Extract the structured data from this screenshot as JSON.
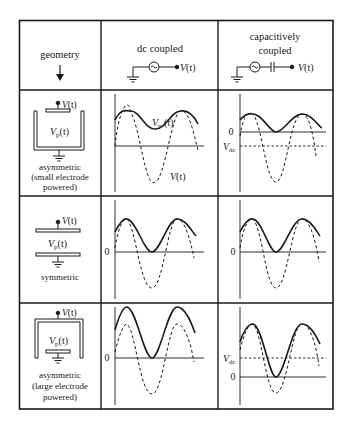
{
  "header": {
    "geometry_label": "geometry",
    "dc_label": "dc coupled",
    "cap_label_line1": "capacitively",
    "cap_label_line2": "coupled",
    "source_output_label": "V(t)"
  },
  "rows": [
    {
      "geometry_name_line1": "asymmetric",
      "geometry_name_line2": "(small electrode",
      "geometry_name_line3": "powered)",
      "electrode_label": "V(t)",
      "plasma_label": "Vp(t)",
      "dc_plot": {
        "vp_label": "Vp(t)",
        "v_label": "V(t)"
      },
      "cap_plot": {
        "zero_label": "0",
        "vdc_label": "Vdc"
      }
    },
    {
      "geometry_name_line1": "symmetric",
      "electrode_label": "V(t)",
      "plasma_label": "Vp(t)",
      "dc_plot": {
        "zero_label": "0"
      },
      "cap_plot": {
        "zero_label": "0"
      }
    },
    {
      "geometry_name_line1": "asymmetric",
      "geometry_name_line2": "(large electrode",
      "geometry_name_line3": "powered)",
      "electrode_label": "V(t)",
      "plasma_label": "Vp(t)",
      "dc_plot": {
        "zero_label": "0"
      },
      "cap_plot": {
        "zero_label": "0",
        "vdc_label": "Vdc"
      }
    }
  ],
  "legend": {
    "solid_curve": "plasma potential Vp(t)",
    "dashed_curve": "applied voltage V(t)"
  },
  "colors": {
    "ink": "#1a1a1a",
    "background": "#ffffff"
  }
}
